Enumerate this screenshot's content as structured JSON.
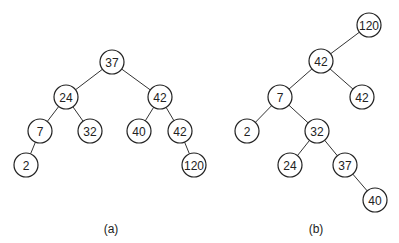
{
  "diagram": {
    "trees": [
      {
        "id": "a",
        "caption": "(a)",
        "caption_pos": [
          111,
          229
        ],
        "nodes": [
          {
            "id": "a_37",
            "label": "37",
            "x": 112,
            "y": 62
          },
          {
            "id": "a_24",
            "label": "24",
            "x": 66,
            "y": 97
          },
          {
            "id": "a_42",
            "label": "42",
            "x": 160,
            "y": 97
          },
          {
            "id": "a_7",
            "label": "7",
            "x": 40,
            "y": 131
          },
          {
            "id": "a_32",
            "label": "32",
            "x": 90,
            "y": 131
          },
          {
            "id": "a_40",
            "label": "40",
            "x": 139,
            "y": 131
          },
          {
            "id": "a_42b",
            "label": "42",
            "x": 180,
            "y": 131
          },
          {
            "id": "a_2",
            "label": "2",
            "x": 26,
            "y": 165
          },
          {
            "id": "a_120",
            "label": "120",
            "x": 194,
            "y": 165
          }
        ],
        "edges": [
          [
            "a_37",
            "a_24"
          ],
          [
            "a_37",
            "a_42"
          ],
          [
            "a_24",
            "a_7"
          ],
          [
            "a_24",
            "a_32"
          ],
          [
            "a_42",
            "a_40"
          ],
          [
            "a_42",
            "a_42b"
          ],
          [
            "a_7",
            "a_2"
          ],
          [
            "a_42b",
            "a_120"
          ]
        ]
      },
      {
        "id": "b",
        "caption": "(b)",
        "caption_pos": [
          316,
          229
        ],
        "nodes": [
          {
            "id": "b_120",
            "label": "120",
            "x": 369,
            "y": 25
          },
          {
            "id": "b_42",
            "label": "42",
            "x": 321,
            "y": 61
          },
          {
            "id": "b_7",
            "label": "7",
            "x": 280,
            "y": 97
          },
          {
            "id": "b_42b",
            "label": "42",
            "x": 362,
            "y": 97
          },
          {
            "id": "b_2",
            "label": "2",
            "x": 247,
            "y": 131
          },
          {
            "id": "b_32",
            "label": "32",
            "x": 317,
            "y": 131
          },
          {
            "id": "b_24",
            "label": "24",
            "x": 290,
            "y": 165
          },
          {
            "id": "b_37",
            "label": "37",
            "x": 345,
            "y": 165
          },
          {
            "id": "b_40",
            "label": "40",
            "x": 375,
            "y": 200
          }
        ],
        "edges": [
          [
            "b_120",
            "b_42"
          ],
          [
            "b_42",
            "b_7"
          ],
          [
            "b_42",
            "b_42b"
          ],
          [
            "b_7",
            "b_2"
          ],
          [
            "b_7",
            "b_32"
          ],
          [
            "b_32",
            "b_24"
          ],
          [
            "b_32",
            "b_37"
          ],
          [
            "b_37",
            "b_40"
          ]
        ]
      }
    ],
    "node_radius": 12,
    "colors": {
      "stroke": "#222222",
      "fill": "#ffffff",
      "text": "#222222"
    }
  }
}
